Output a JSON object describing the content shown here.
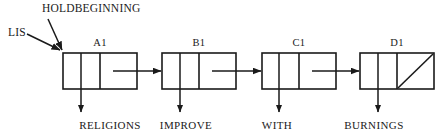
{
  "diagram": {
    "type": "singly-linked-list",
    "title_pointers": [
      {
        "name": "holdbeginning-pointer-label",
        "text": "HOLDBEGINNING",
        "x": 42,
        "y": 4
      },
      {
        "name": "lis-pointer-label",
        "text": "LIS",
        "x": 8,
        "y": 28
      }
    ],
    "nodes": [
      {
        "id": "node-a1",
        "label": "A1",
        "data_label": "RELIGIONS",
        "box_x": 63,
        "box_w": 74,
        "split_x": 100,
        "center_x": 100,
        "data_center_x": 110,
        "null_pointer": false
      },
      {
        "id": "node-b1",
        "label": "B1",
        "data_label": "IMPROVE",
        "box_x": 162,
        "box_w": 74,
        "split_x": 199,
        "center_x": 199,
        "data_center_x": 186,
        "null_pointer": false
      },
      {
        "id": "node-c1",
        "label": "C1",
        "data_label": "WITH",
        "box_x": 262,
        "box_w": 74,
        "split_x": 299,
        "center_x": 299,
        "data_center_x": 277,
        "null_pointer": false
      },
      {
        "id": "node-d1",
        "label": "D1",
        "data_label": "BURNINGS",
        "box_x": 360,
        "box_w": 74,
        "split_x": 397,
        "center_x": 397,
        "data_center_x": 374,
        "null_pointer": true
      }
    ],
    "geometry": {
      "box_y": 53,
      "box_h": 36,
      "label_y": 38,
      "data_label_y": 122,
      "down_arrow_from_y": 53,
      "down_arrow_to_y": 112,
      "link_arrow_y": 71
    },
    "colors": {
      "stroke": "#1a1a1a",
      "text": "#1a1a1a",
      "background": "#ffffff"
    },
    "stroke_width": 1.6
  }
}
